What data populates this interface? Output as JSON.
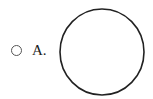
{
  "question": {
    "options": [
      {
        "label": "A.",
        "selected": false,
        "figure": {
          "shape": "circle",
          "stroke": "#222222",
          "fill": "#ffffff"
        }
      }
    ]
  }
}
